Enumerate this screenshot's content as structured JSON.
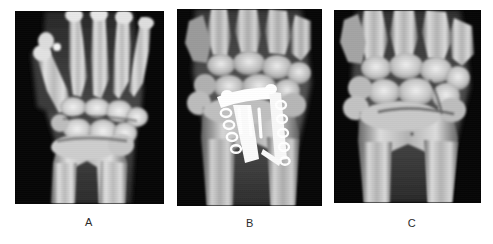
{
  "figure": {
    "background_color": "#ffffff",
    "width": 493,
    "height": 244,
    "caption_color": "#2b2b2b",
    "panel_count": 3
  },
  "panels": [
    {
      "id": "A",
      "label": "A",
      "modality": "radiograph",
      "view": "posteroanterior",
      "body_part": "wrist and hand",
      "hardware_present": "none",
      "background_color": "#050505",
      "bone_color": "#d8d8d8",
      "soft_tissue_color": "#4a4a4a",
      "rect": {
        "x": 15,
        "y": 11,
        "width": 149,
        "height": 193
      }
    },
    {
      "id": "B",
      "label": "B",
      "modality": "radiograph",
      "view": "posteroanterior",
      "body_part": "wrist",
      "hardware_present": "volar plate with screws",
      "hardware_color": "#ffffff",
      "plate_screw_count": 9,
      "background_color": "#050505",
      "bone_color": "#cfcfcf",
      "soft_tissue_color": "#555555",
      "rect": {
        "x": 177,
        "y": 9,
        "width": 145,
        "height": 197
      }
    },
    {
      "id": "C",
      "label": "C",
      "modality": "radiograph",
      "view": "posteroanterior",
      "body_part": "wrist",
      "hardware_present": "none",
      "background_color": "#050505",
      "bone_color": "#d5d5d5",
      "soft_tissue_color": "#4f4f4f",
      "rect": {
        "x": 334,
        "y": 10,
        "width": 147,
        "height": 193
      }
    }
  ],
  "captions": [
    {
      "text": "A",
      "x": 89,
      "y": 216
    },
    {
      "text": "B",
      "x": 250,
      "y": 217
    },
    {
      "text": "C",
      "x": 412,
      "y": 217
    }
  ]
}
